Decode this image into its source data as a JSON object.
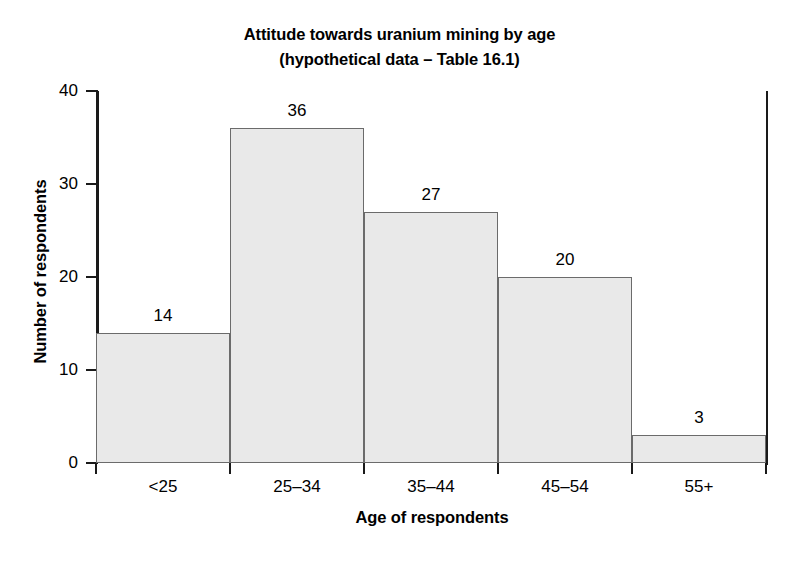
{
  "chart_data": {
    "type": "bar",
    "title": "Attitude towards uranium mining by age",
    "subtitle": "(hypothetical data – Table 16.1)",
    "xlabel": "Age of respondents",
    "ylabel": "Number of respondents",
    "categories": [
      "<25",
      "25–34",
      "35–44",
      "45–54",
      "55+"
    ],
    "values": [
      14,
      36,
      27,
      20,
      3
    ],
    "value_labels": [
      "14",
      "36",
      "27",
      "20",
      "3"
    ],
    "ylim": [
      0,
      40
    ],
    "yticks": [
      0,
      10,
      20,
      30,
      40
    ],
    "ytick_labels": [
      "0",
      "10",
      "20",
      "30",
      "40"
    ],
    "grid": false,
    "legend": false,
    "bar_gap": 0,
    "colors": {
      "bar_fill": "#e9e9e9",
      "bar_edge": "#6b6b6b",
      "axis": "#1a1a1a",
      "text": "#000000",
      "background": "#ffffff"
    }
  }
}
